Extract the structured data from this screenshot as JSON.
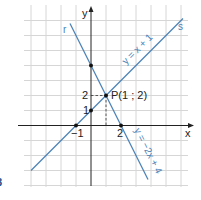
{
  "figure": {
    "number_label": "8",
    "colors": {
      "grid": "#d6d6d6",
      "axis": "#222222",
      "line": "#4a82b8",
      "point": "#111111",
      "figure_number": "#1f4e8c"
    }
  },
  "axes": {
    "x_label": "x",
    "y_label": "y",
    "origin_px": [
      91,
      125.5
    ],
    "unit_px": 15,
    "x_range": [
      -4,
      6
    ],
    "y_range": [
      -4,
      8
    ],
    "tick_labels": {
      "x_neg1": "−1",
      "x_2": "2",
      "y_1": "1",
      "y_2": "2"
    }
  },
  "lines": [
    {
      "name": "s",
      "label": "s",
      "equation": "y = x + 1",
      "slope": 1,
      "intercept": 1
    },
    {
      "name": "r",
      "label": "r",
      "equation": "y = −2x + 4",
      "slope": -2,
      "intercept": 4
    }
  ],
  "points": [
    {
      "name": "P",
      "label": "P(1 ; 2)",
      "x": 1,
      "y": 2
    },
    {
      "name": "s-y-intercept",
      "x": 0,
      "y": 1
    },
    {
      "name": "s-x-intercept",
      "x": -1,
      "y": 0
    },
    {
      "name": "r-y-intercept",
      "x": 0,
      "y": 4
    },
    {
      "name": "r-x-intercept",
      "x": 2,
      "y": 0
    }
  ]
}
